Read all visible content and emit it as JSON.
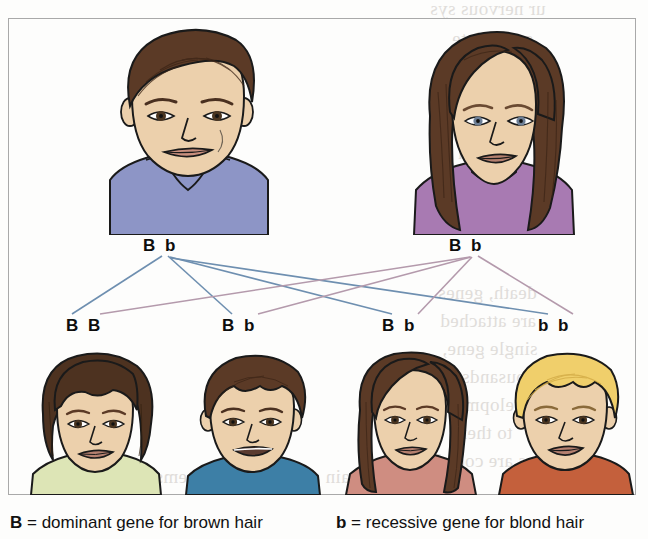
{
  "diagram": {
    "type": "genetics-punnett-family-pedigree",
    "parents": [
      {
        "id": "father",
        "label": "B b",
        "genotype": [
          "B",
          "b"
        ],
        "sex": "male",
        "hair": "brown",
        "hair_color": "#5b3a26",
        "skin_color": "#ecd0ac",
        "clothing_color": "#8d95c6",
        "x": 186,
        "y": 124
      },
      {
        "id": "mother",
        "label": "B b",
        "genotype": [
          "B",
          "b"
        ],
        "sex": "female",
        "hair": "brown",
        "hair_color": "#5b3a26",
        "skin_color": "#ecd0ac",
        "clothing_color": "#a87ab2",
        "x": 492,
        "y": 124
      }
    ],
    "children": [
      {
        "id": "child-1",
        "label": "B B",
        "genotype": [
          "B",
          "b"
        ],
        "sex": "female",
        "hair": "brown",
        "hair_color": "#4d3220",
        "skin_color": "#ecd0ac",
        "clothing_color": "#dde5b6",
        "x": 95,
        "y": 425
      },
      {
        "id": "child-2",
        "label": "B b",
        "genotype": [
          "B",
          "b"
        ],
        "sex": "male",
        "hair": "brown",
        "hair_color": "#5b3a26",
        "skin_color": "#ecd0ac",
        "clothing_color": "#3d7fa6",
        "x": 250,
        "y": 425
      },
      {
        "id": "child-3",
        "label": "B b",
        "genotype": [
          "B",
          "b"
        ],
        "sex": "female",
        "hair": "brown",
        "hair_color": "#5b3a26",
        "skin_color": "#ecd0ac",
        "clothing_color": "#cf8d81",
        "x": 410,
        "y": 425
      },
      {
        "id": "child-4",
        "label": "b b",
        "genotype": [
          "b",
          "b"
        ],
        "sex": "male",
        "hair": "blond",
        "hair_color": "#f0cf6b",
        "skin_color": "#ecd0ac",
        "clothing_color": "#c4603c",
        "x": 565,
        "y": 425
      }
    ],
    "legend": {
      "dominant": {
        "allele": "B",
        "text": " = dominant gene for brown hair"
      },
      "recessive": {
        "allele": "b",
        "text": " = recessive gene for blond hair"
      }
    },
    "line_colors": {
      "father": "#6e8fb0",
      "mother": "#b49aac"
    }
  },
  "bleed_through": [
    {
      "text": "ur nervous sys",
      "x": 430,
      "y": -2
    },
    {
      "text": "s, mediate",
      "x": 452,
      "y": 28
    },
    {
      "text": "as you pre",
      "x": 448,
      "y": 88
    },
    {
      "text": "any given",
      "x": 452,
      "y": 114
    },
    {
      "text": "others a",
      "x": 458,
      "y": 142
    },
    {
      "text": "mainly at",
      "x": 452,
      "y": 170
    },
    {
      "text": "death, genes",
      "x": 438,
      "y": 282
    },
    {
      "text": "are attached",
      "x": 440,
      "y": 310
    },
    {
      "text": "single gene,",
      "x": 442,
      "y": 338
    },
    {
      "text": "thousands of",
      "x": 440,
      "y": 366
    },
    {
      "text": "developmenl",
      "x": 440,
      "y": 394
    },
    {
      "text": "to them",
      "x": 452,
      "y": 422
    },
    {
      "text": "ws are coded",
      "x": 436,
      "y": 450
    },
    {
      "text": "ncluding the brain and nervous systems that",
      "x": 120,
      "y": 466
    }
  ]
}
